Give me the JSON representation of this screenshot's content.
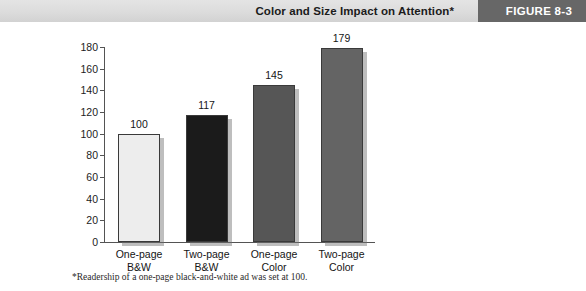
{
  "header": {
    "title": "Color and Size Impact on Attention*",
    "figure_label": "FIGURE 8-3",
    "band_color": "#dcdcdc",
    "tab_color": "#676767",
    "tab_text_color": "#ffffff"
  },
  "footnote": "*Readership of a one-page black-and-white ad was set at 100.",
  "chart_data": {
    "type": "bar",
    "title": "Color and Size Impact on Attention*",
    "xlabel": "",
    "ylabel": "",
    "ylim": [
      0,
      180
    ],
    "yticks": [
      0,
      20,
      40,
      60,
      80,
      100,
      120,
      140,
      160,
      180
    ],
    "grid": false,
    "legend": "none",
    "categories": [
      "One-page B&W",
      "Two-page B&W",
      "One-page Color",
      "Two-page Color"
    ],
    "category_lines": [
      [
        "One-page",
        "B&W"
      ],
      [
        "Two-page",
        "B&W"
      ],
      [
        "One-page",
        "Color"
      ],
      [
        "Two-page",
        "Color"
      ]
    ],
    "values": [
      100,
      117,
      145,
      179
    ],
    "value_labels": [
      "100",
      "117",
      "145",
      "179"
    ],
    "bar_colors": [
      "#ededed",
      "#1b1b1b",
      "#565656",
      "#646464"
    ],
    "bar_border_color": "#3a3a3a",
    "annotation": "*Readership of a one-page black-and-white ad was set at 100."
  }
}
